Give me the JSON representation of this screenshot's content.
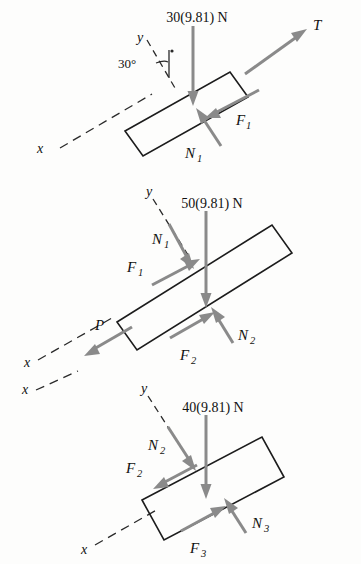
{
  "figure": {
    "incline_angle": "30°",
    "stroke_color": "#1c1c1c",
    "vector_color": "#8a8a8a",
    "background": "#fdfdfc"
  },
  "diagrams": [
    {
      "id": "block-1",
      "weight_label": "30(9.81) N",
      "axis_x_label": "x",
      "axis_y_label": "y",
      "angle_label": "30°",
      "forces": [
        {
          "name": "tension",
          "label": "T",
          "sub": ""
        },
        {
          "name": "friction-1",
          "label": "F",
          "sub": "1"
        },
        {
          "name": "normal-1",
          "label": "N",
          "sub": "1"
        },
        {
          "name": "weight",
          "label": "30(9.81) N",
          "sub": ""
        }
      ]
    },
    {
      "id": "block-2",
      "weight_label": "50(9.81) N",
      "axis_x_label": "x",
      "axis_y_label": "y",
      "forces": [
        {
          "name": "applied-force",
          "label": "P",
          "sub": ""
        },
        {
          "name": "normal-1",
          "label": "N",
          "sub": "1"
        },
        {
          "name": "friction-1",
          "label": "F",
          "sub": "1"
        },
        {
          "name": "normal-2",
          "label": "N",
          "sub": "2"
        },
        {
          "name": "friction-2",
          "label": "F",
          "sub": "2"
        },
        {
          "name": "weight",
          "label": "50(9.81) N",
          "sub": ""
        }
      ]
    },
    {
      "id": "block-3",
      "weight_label": "40(9.81) N",
      "axis_x_label": "x",
      "axis_y_label": "y",
      "forces": [
        {
          "name": "normal-2",
          "label": "N",
          "sub": "2"
        },
        {
          "name": "friction-2",
          "label": "F",
          "sub": "2"
        },
        {
          "name": "normal-3",
          "label": "N",
          "sub": "3"
        },
        {
          "name": "friction-3",
          "label": "F",
          "sub": "3"
        },
        {
          "name": "weight",
          "label": "40(9.81) N",
          "sub": ""
        }
      ]
    }
  ]
}
